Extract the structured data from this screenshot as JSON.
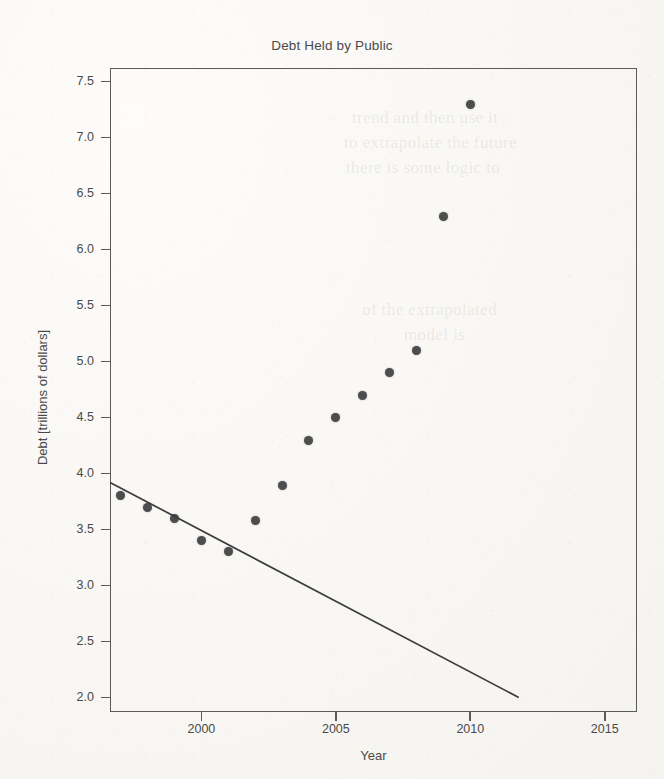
{
  "chart_data": {
    "type": "scatter",
    "title": "Debt Held by Public",
    "xlabel": "Year",
    "ylabel": "Debt [trillions of dollars]",
    "xlim": [
      1996.6,
      2016.2
    ],
    "ylim": [
      1.87,
      7.62
    ],
    "grid": false,
    "legend": null,
    "x": [
      1997,
      1998,
      1999,
      2000,
      2001,
      2002,
      2003,
      2004,
      2005,
      2006,
      2007,
      2008,
      2009,
      2010
    ],
    "values": [
      3.8,
      3.7,
      3.6,
      3.4,
      3.3,
      3.58,
      3.89,
      4.29,
      4.5,
      4.7,
      4.9,
      5.1,
      6.29,
      7.29
    ],
    "series": [
      {
        "name": "Debt Held by Public",
        "points": [
          {
            "x": 1997,
            "y": 3.8
          },
          {
            "x": 1998,
            "y": 3.7
          },
          {
            "x": 1999,
            "y": 3.6
          },
          {
            "x": 2000,
            "y": 3.4
          },
          {
            "x": 2001,
            "y": 3.3
          },
          {
            "x": 2002,
            "y": 3.58
          },
          {
            "x": 2003,
            "y": 3.89
          },
          {
            "x": 2004,
            "y": 4.29
          },
          {
            "x": 2005,
            "y": 4.5
          },
          {
            "x": 2006,
            "y": 4.7
          },
          {
            "x": 2007,
            "y": 4.9
          },
          {
            "x": 2008,
            "y": 5.1
          },
          {
            "x": 2009,
            "y": 6.29
          },
          {
            "x": 2010,
            "y": 7.29
          }
        ]
      }
    ],
    "trendline": {
      "name": "extrapolated linear fit",
      "x_start": 1996.6,
      "y_start": 3.92,
      "x_end": 2011.8,
      "y_end": 2.0
    },
    "xticks": [
      2000,
      2005,
      2010,
      2015
    ],
    "xtick_labels": [
      "2000",
      "2005",
      "2010",
      "2015"
    ],
    "yticks": [
      2.0,
      2.5,
      3.0,
      3.5,
      4.0,
      4.5,
      5.0,
      5.5,
      6.0,
      6.5,
      7.0,
      7.5
    ],
    "ytick_labels": [
      "2.0",
      "2.5",
      "3.0",
      "3.5",
      "4.0",
      "4.5",
      "5.0",
      "5.5",
      "6.0",
      "6.5",
      "7.0",
      "7.5"
    ],
    "colors": {
      "marker": "#4d4d50",
      "trendline": "#3c3c3c",
      "axis": "#5a5a5a",
      "text": "#4a4a4a",
      "background": "#f8f7f4"
    }
  },
  "bleed_through": [
    {
      "text": "trend and then use it",
      "x": 352,
      "y": 108
    },
    {
      "text": "to extrapolate the future",
      "x": 344,
      "y": 133
    },
    {
      "text": "there is some logic to",
      "x": 346,
      "y": 158
    },
    {
      "text": "of the extrapolated",
      "x": 362,
      "y": 300
    },
    {
      "text": "model is",
      "x": 404,
      "y": 325
    }
  ]
}
